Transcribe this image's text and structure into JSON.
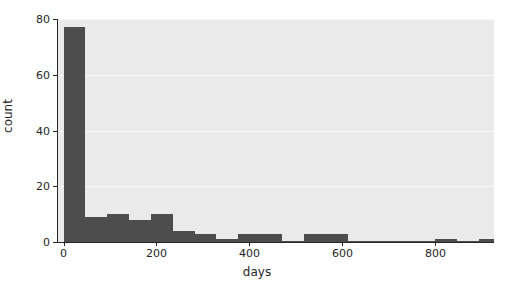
{
  "chart_data": {
    "type": "bar",
    "subtype": "histogram",
    "title": "",
    "xlabel": "days",
    "ylabel": "count",
    "xlim": [
      -14,
      926
    ],
    "ylim": [
      0,
      80
    ],
    "bin_width": 47,
    "grid": true,
    "grid_axis": "y",
    "legend": null,
    "bar_color": "#4d4d4d",
    "plot_background": "#eaeaea",
    "figure_background": "#ffffff",
    "axis_color": "#262626",
    "gridline_color": "#f7f7f7",
    "xticks": [
      0,
      200,
      400,
      600,
      800
    ],
    "xtick_labels": [
      "0",
      "200",
      "400",
      "600",
      "800"
    ],
    "yticks": [
      0,
      20,
      40,
      60,
      80
    ],
    "ytick_labels": [
      "0",
      "20",
      "40",
      "60",
      "80"
    ],
    "bin_edges": [
      0,
      47,
      94,
      141,
      188,
      235,
      282,
      329,
      376,
      423,
      470,
      517,
      564,
      611,
      658,
      705,
      752,
      799,
      846,
      893,
      940
    ],
    "bin_centers": [
      23.5,
      70.5,
      117.5,
      164.5,
      211.5,
      258.5,
      305.5,
      352.5,
      399.5,
      446.5,
      493.5,
      540.5,
      587.5,
      634.5,
      681.5,
      728.5,
      775.5,
      822.5,
      869.5,
      916.5
    ],
    "values": [
      77,
      9,
      10,
      8,
      10,
      4,
      3,
      1,
      3,
      3,
      0,
      3,
      3,
      0,
      0,
      0,
      0,
      1,
      0,
      1
    ],
    "categories": [
      "0-47",
      "47-94",
      "94-141",
      "141-188",
      "188-235",
      "235-282",
      "282-329",
      "329-376",
      "376-423",
      "423-470",
      "470-517",
      "517-564",
      "564-611",
      "611-658",
      "658-705",
      "705-752",
      "752-799",
      "799-846",
      "846-893",
      "893-940"
    ]
  }
}
